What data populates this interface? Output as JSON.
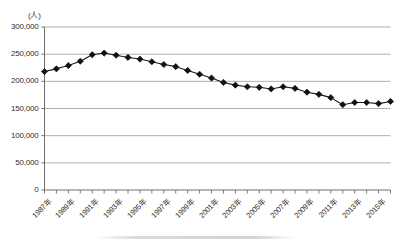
{
  "chart_data": {
    "type": "line",
    "title": "",
    "xlabel": "",
    "ylabel": "",
    "unit_label": "(人)",
    "grid": true,
    "legend": "none",
    "ylim": [
      0,
      300000
    ],
    "ytick_step": 50000,
    "ytick_labels": [
      "300,000",
      "250,000",
      "200,000",
      "150,000",
      "100,000",
      "50,000",
      "0"
    ],
    "ytick_values": [
      300000,
      250000,
      200000,
      150000,
      100000,
      50000,
      0
    ],
    "xlim": [
      1987,
      2016
    ],
    "xtick_labels": [
      "1987年",
      "1989年",
      "1991年",
      "1993年",
      "1995年",
      "1997年",
      "1999年",
      "2001年",
      "2003年",
      "2005年",
      "2007年",
      "2009年",
      "2011年",
      "2013年",
      "2015年"
    ],
    "xtick_values": [
      1987,
      1989,
      1991,
      1993,
      1995,
      1997,
      1999,
      2001,
      2003,
      2005,
      2007,
      2009,
      2011,
      2013,
      2015
    ],
    "x": [
      1987,
      1988,
      1989,
      1990,
      1991,
      1992,
      1993,
      1994,
      1995,
      1996,
      1997,
      1998,
      1999,
      2000,
      2001,
      2002,
      2003,
      2004,
      2005,
      2006,
      2007,
      2008,
      2009,
      2010,
      2011,
      2012,
      2013,
      2014,
      2015,
      2016
    ],
    "values": [
      218000,
      223000,
      229000,
      237000,
      249000,
      252000,
      248000,
      244000,
      241000,
      236000,
      231000,
      227000,
      220000,
      213000,
      206000,
      198000,
      193000,
      190000,
      189000,
      186000,
      190000,
      187000,
      180000,
      176000,
      170000,
      157000,
      161000,
      161000,
      159000,
      163000
    ],
    "marker": "diamond",
    "marker_color": "#111111",
    "line_color": "#1a1a1a"
  }
}
